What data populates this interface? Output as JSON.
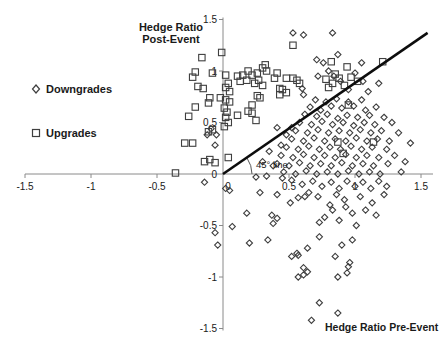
{
  "chart_data": {
    "type": "scatter",
    "y_axis_title": "Hedge Ratio\nPost-Event",
    "x_axis_title": "Hedge Ratio Pre-Event",
    "annotation": "45° line",
    "xlim": [
      -1.5,
      1.5
    ],
    "ylim": [
      -1.5,
      1.5
    ],
    "x_ticks": [
      -1.5,
      -1,
      -0.5,
      0,
      0.5,
      1,
      1.5
    ],
    "x_tick_labels": [
      "-1.5",
      "-1",
      "-0.5",
      "0",
      "0.5",
      "1",
      "1.5"
    ],
    "y_ticks": [
      -1.5,
      -1,
      -0.5,
      0,
      0.5,
      1,
      1.5
    ],
    "y_tick_labels": [
      "-1.5",
      "-1",
      "-0.5",
      "0",
      "0.5",
      "1",
      "1.5"
    ],
    "grid": false,
    "legend_position": "left",
    "reference_line": {
      "label": "45° line",
      "from": [
        0,
        0
      ],
      "to": [
        1.55,
        1.37
      ]
    },
    "colors": {
      "marker_stroke": "#3f3f3f",
      "reference_line": "#0d0d0d",
      "axis": "#8a8a8a",
      "text": "#1a1a1a"
    },
    "legend": [
      {
        "name": "Downgrades",
        "marker": "diamond"
      },
      {
        "name": "Upgrades",
        "marker": "square"
      }
    ],
    "series": [
      {
        "name": "Downgrades",
        "marker": "diamond",
        "points": [
          [
            0.53,
            1.37
          ],
          [
            0.61,
            1.35
          ],
          [
            0.83,
            1.37
          ],
          [
            0.71,
            1.11
          ],
          [
            0.76,
            1.08
          ],
          [
            0.87,
            1.16
          ],
          [
            1.05,
            1.08
          ],
          [
            0.84,
            0.95
          ],
          [
            0.89,
            0.9
          ],
          [
            1.0,
            0.98
          ],
          [
            1.06,
            0.9
          ],
          [
            0.6,
            0.83
          ],
          [
            0.61,
            0.77
          ],
          [
            0.72,
            0.95
          ],
          [
            0.8,
            1.0
          ],
          [
            1.18,
            0.88
          ],
          [
            0.95,
            0.82
          ],
          [
            1.1,
            0.8
          ],
          [
            -0.12,
            0.38
          ],
          [
            -0.05,
            0.38
          ],
          [
            -0.09,
            0.44
          ],
          [
            -0.06,
            0.28
          ],
          [
            0.41,
            0.45
          ],
          [
            0.48,
            0.38
          ],
          [
            0.35,
            0.22
          ],
          [
            0.44,
            0.28
          ],
          [
            0.52,
            0.45
          ],
          [
            0.3,
            0.12
          ],
          [
            0.38,
            0.08
          ],
          [
            0.25,
            -0.03
          ],
          [
            0.33,
            -0.02
          ],
          [
            0.7,
            0.72
          ],
          [
            0.78,
            0.7
          ],
          [
            0.86,
            0.73
          ],
          [
            0.95,
            0.7
          ],
          [
            1.05,
            0.72
          ],
          [
            0.66,
            0.65
          ],
          [
            0.74,
            0.62
          ],
          [
            0.82,
            0.66
          ],
          [
            0.9,
            0.64
          ],
          [
            0.99,
            0.66
          ],
          [
            1.08,
            0.62
          ],
          [
            1.16,
            0.65
          ],
          [
            0.62,
            0.58
          ],
          [
            0.71,
            0.56
          ],
          [
            0.79,
            0.58
          ],
          [
            0.87,
            0.54
          ],
          [
            0.94,
            0.57
          ],
          [
            1.02,
            0.55
          ],
          [
            1.11,
            0.57
          ],
          [
            1.22,
            0.55
          ],
          [
            0.58,
            0.5
          ],
          [
            0.67,
            0.48
          ],
          [
            0.75,
            0.51
          ],
          [
            0.83,
            0.48
          ],
          [
            0.91,
            0.5
          ],
          [
            0.99,
            0.47
          ],
          [
            1.07,
            0.5
          ],
          [
            1.15,
            0.48
          ],
          [
            1.28,
            0.5
          ],
          [
            0.55,
            0.42
          ],
          [
            0.64,
            0.4
          ],
          [
            0.72,
            0.43
          ],
          [
            0.8,
            0.4
          ],
          [
            0.88,
            0.42
          ],
          [
            0.96,
            0.4
          ],
          [
            1.04,
            0.43
          ],
          [
            1.12,
            0.4
          ],
          [
            1.2,
            0.42
          ],
          [
            1.33,
            0.4
          ],
          [
            0.52,
            0.34
          ],
          [
            0.61,
            0.32
          ],
          [
            0.69,
            0.35
          ],
          [
            0.77,
            0.32
          ],
          [
            0.85,
            0.34
          ],
          [
            0.93,
            0.32
          ],
          [
            1.01,
            0.35
          ],
          [
            1.09,
            0.32
          ],
          [
            1.17,
            0.34
          ],
          [
            1.26,
            0.32
          ],
          [
            0.48,
            0.26
          ],
          [
            0.57,
            0.24
          ],
          [
            0.65,
            0.27
          ],
          [
            0.73,
            0.24
          ],
          [
            0.81,
            0.26
          ],
          [
            0.89,
            0.24
          ],
          [
            0.97,
            0.27
          ],
          [
            1.05,
            0.24
          ],
          [
            1.13,
            0.26
          ],
          [
            1.24,
            0.24
          ],
          [
            0.44,
            0.18
          ],
          [
            0.53,
            0.16
          ],
          [
            0.61,
            0.19
          ],
          [
            0.69,
            0.16
          ],
          [
            0.77,
            0.18
          ],
          [
            0.85,
            0.16
          ],
          [
            0.93,
            0.19
          ],
          [
            1.01,
            0.16
          ],
          [
            1.09,
            0.18
          ],
          [
            1.18,
            0.16
          ],
          [
            1.3,
            0.18
          ],
          [
            0.41,
            0.1
          ],
          [
            0.5,
            0.08
          ],
          [
            0.58,
            0.11
          ],
          [
            0.66,
            0.08
          ],
          [
            0.74,
            0.1
          ],
          [
            0.82,
            0.08
          ],
          [
            0.9,
            0.11
          ],
          [
            0.98,
            0.08
          ],
          [
            1.06,
            0.1
          ],
          [
            1.14,
            0.08
          ],
          [
            1.25,
            0.1
          ],
          [
            0.46,
            0.02
          ],
          [
            0.55,
            0.0
          ],
          [
            0.63,
            0.03
          ],
          [
            0.71,
            0.0
          ],
          [
            0.79,
            0.02
          ],
          [
            0.87,
            0.0
          ],
          [
            0.95,
            0.03
          ],
          [
            1.03,
            0.0
          ],
          [
            1.11,
            0.02
          ],
          [
            1.19,
            0.0
          ],
          [
            1.35,
            0.02
          ],
          [
            1.42,
            0.3
          ],
          [
            1.38,
            0.12
          ],
          [
            0.57,
            -0.23
          ],
          [
            0.62,
            -0.22
          ],
          [
            0.81,
            -0.3
          ],
          [
            0.83,
            -0.35
          ],
          [
            0.77,
            -0.42
          ],
          [
            0.73,
            -0.47
          ],
          [
            0.98,
            -0.38
          ],
          [
            1.01,
            -0.5
          ],
          [
            1.08,
            -0.35
          ],
          [
            0.52,
            -0.06
          ],
          [
            0.6,
            -0.1
          ],
          [
            0.68,
            -0.07
          ],
          [
            0.75,
            -0.12
          ],
          [
            0.82,
            -0.08
          ],
          [
            0.88,
            -0.14
          ],
          [
            0.94,
            -0.07
          ],
          [
            1.0,
            -0.12
          ],
          [
            1.06,
            -0.08
          ],
          [
            1.12,
            -0.14
          ],
          [
            1.18,
            -0.07
          ],
          [
            0.65,
            -0.18
          ],
          [
            0.72,
            -0.22
          ],
          [
            0.86,
            -0.2
          ],
          [
            0.92,
            -0.25
          ],
          [
            1.04,
            -0.22
          ],
          [
            1.13,
            -0.28
          ],
          [
            1.22,
            -0.2
          ],
          [
            0.88,
            -0.45
          ],
          [
            0.93,
            -0.32
          ],
          [
            1.16,
            -0.4
          ],
          [
            1.24,
            -0.12
          ],
          [
            0.45,
            -0.04
          ],
          [
            0.73,
            -0.61
          ],
          [
            0.9,
            -0.69
          ],
          [
            0.98,
            -0.64
          ],
          [
            0.64,
            -0.72
          ],
          [
            0.56,
            -0.77
          ],
          [
            0.52,
            -0.8
          ],
          [
            0.85,
            -0.8
          ],
          [
            0.96,
            -0.86
          ],
          [
            0.95,
            -0.9
          ],
          [
            0.57,
            -0.79
          ],
          [
            -0.14,
            -0.08
          ],
          [
            0.02,
            -0.14
          ],
          [
            0.05,
            -0.16
          ],
          [
            0.28,
            -0.18
          ],
          [
            0.41,
            -0.2
          ],
          [
            0.51,
            -0.28
          ],
          [
            0.18,
            -0.38
          ],
          [
            0.37,
            -0.4
          ],
          [
            0.41,
            -0.43
          ],
          [
            0.38,
            -0.48
          ],
          [
            0.07,
            -0.51
          ],
          [
            -0.06,
            -0.57
          ],
          [
            -0.04,
            -0.69
          ],
          [
            0.2,
            -0.67
          ],
          [
            0.34,
            -0.64
          ],
          [
            0.61,
            -0.91
          ],
          [
            0.64,
            -0.95
          ],
          [
            0.57,
            -1.0
          ],
          [
            0.61,
            -0.98
          ],
          [
            0.87,
            -1.0
          ],
          [
            0.94,
            -0.96
          ],
          [
            0.73,
            -1.25
          ],
          [
            0.87,
            -1.35
          ],
          [
            0.67,
            -1.42
          ]
        ]
      },
      {
        "name": "Upgrades",
        "marker": "square",
        "points": [
          [
            -0.36,
            0.01
          ],
          [
            -0.21,
            0.99
          ],
          [
            -0.23,
            0.94
          ],
          [
            -0.19,
            0.85
          ],
          [
            -0.15,
            0.83
          ],
          [
            -0.16,
            1.13
          ],
          [
            -0.08,
            0.98
          ],
          [
            -0.1,
            0.74
          ],
          [
            -0.02,
            0.74
          ],
          [
            -0.21,
            0.65
          ],
          [
            -0.11,
            0.69
          ],
          [
            -0.29,
            0.3
          ],
          [
            -0.23,
            0.3
          ],
          [
            -0.11,
            0.41
          ],
          [
            -0.08,
            0.43
          ],
          [
            -0.14,
            0.12
          ],
          [
            -0.1,
            0.14
          ],
          [
            -0.06,
            0.11
          ],
          [
            -0.26,
            0.56
          ],
          [
            0.02,
            0.96
          ],
          [
            0.04,
            0.88
          ],
          [
            0.02,
            0.84
          ],
          [
            0.05,
            0.8
          ],
          [
            0.02,
            0.72
          ],
          [
            0.05,
            0.7
          ],
          [
            0.01,
            0.64
          ],
          [
            0.03,
            0.6
          ],
          [
            0.02,
            0.55
          ],
          [
            0.04,
            0.5
          ],
          [
            0.01,
            0.46
          ],
          [
            0.04,
            0.16
          ],
          [
            0.11,
            0.95
          ],
          [
            0.15,
            0.96
          ],
          [
            0.19,
            1.0
          ],
          [
            0.22,
            0.96
          ],
          [
            0.26,
            0.98
          ],
          [
            0.3,
            1.03
          ],
          [
            0.32,
            1.06
          ],
          [
            0.33,
            1.0
          ],
          [
            0.27,
            0.91
          ],
          [
            0.24,
            0.88
          ],
          [
            0.3,
            0.86
          ],
          [
            0.18,
            0.91
          ],
          [
            0.13,
            0.9
          ],
          [
            0.41,
            0.98
          ],
          [
            0.39,
            0.93
          ],
          [
            0.48,
            0.93
          ],
          [
            0.53,
            0.93
          ],
          [
            0.56,
            0.91
          ],
          [
            0.58,
            0.88
          ],
          [
            0.43,
            0.83
          ],
          [
            0.45,
            0.82
          ],
          [
            0.48,
            0.79
          ],
          [
            0.43,
            0.77
          ],
          [
            0.26,
            0.76
          ],
          [
            0.28,
            0.74
          ],
          [
            0.22,
            0.67
          ],
          [
            0.19,
            0.61
          ],
          [
            0.22,
            0.59
          ],
          [
            0.11,
            0.57
          ],
          [
            0.25,
            0.52
          ],
          [
            -0.01,
            1.18
          ],
          [
            0.53,
            1.25
          ],
          [
            0.82,
            1.09
          ],
          [
            0.94,
            1.04
          ],
          [
            1.21,
            1.09
          ],
          [
            0.78,
            0.92
          ],
          [
            0.83,
            0.88
          ],
          [
            0.88,
            0.93
          ],
          [
            0.92,
            0.86
          ],
          [
            0.85,
            0.97
          ],
          [
            0.97,
            0.94
          ],
          [
            1.02,
            0.9
          ],
          [
            0.8,
            0.84
          ],
          [
            0.95,
            0.67
          ],
          [
            1.14,
            0.31
          ],
          [
            0.87,
            0.31
          ],
          [
            0.91,
            0.2
          ]
        ]
      }
    ]
  }
}
